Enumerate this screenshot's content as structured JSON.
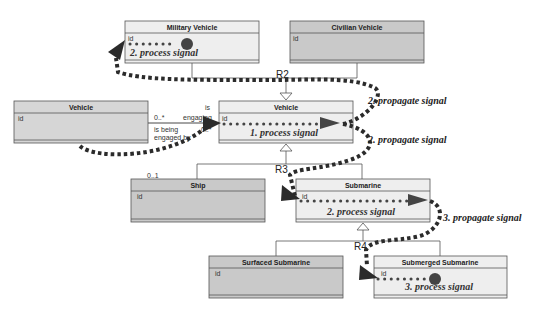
{
  "diagram": {
    "type": "uml-class-diagram-signal-propagation",
    "colors": {
      "light_box": "#eeeeee",
      "dark_box": "#c9c9c9",
      "border": "#555555",
      "path": "#2b2b2b",
      "dot": "#444444"
    },
    "classes": {
      "military_vehicle": {
        "name": "Military Vehicle",
        "attr": "id",
        "signal": "2.  process signal"
      },
      "civilian_vehicle": {
        "name": "Civilian Vehicle",
        "attr": "id"
      },
      "vehicle_left": {
        "name": "Vehicle",
        "attr": "id"
      },
      "vehicle_center": {
        "name": "Vehicle",
        "attr": "id",
        "signal": "1.  process signal"
      },
      "ship": {
        "name": "Ship",
        "attr": "id"
      },
      "submarine": {
        "name": "Submarine",
        "attr": "id",
        "signal": "2.  process signal"
      },
      "surfaced_submarine": {
        "name": "Surfaced Submarine",
        "attr": "id"
      },
      "submerged_submarine": {
        "name": "Submerged Submarine",
        "attr": "id",
        "signal": "3.  process signal"
      }
    },
    "relationships": {
      "r2": "R2",
      "r3": "R3",
      "r4": "R4"
    },
    "association": {
      "mult_left": "0..*",
      "role_top_1": "is",
      "role_top_2": "engaging",
      "role_bottom_1": "is being",
      "role_bottom_2": "engaged by",
      "mult_right": "0..*",
      "ship_mult": "0..1"
    },
    "annotations": {
      "propagate_1": "2.  propagate signal",
      "propagate_2": "2.  propagate signal",
      "propagate_3": "3.  propagate signal"
    }
  }
}
